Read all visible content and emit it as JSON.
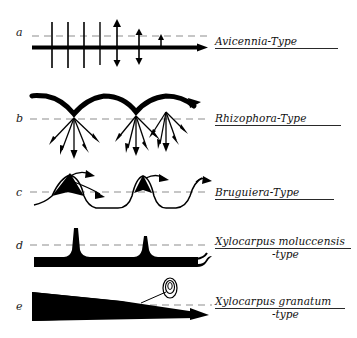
{
  "figure": {
    "background_color": "#ffffff",
    "ink_color": "#000000",
    "dashed_line_color": "#8d8d8d",
    "width": 357,
    "height": 338
  },
  "rows": [
    {
      "letter": "a",
      "label_line1": "Avicennia",
      "label_separator": "-",
      "label_line2": "Type",
      "label_full": "Avicennia-Type",
      "underline": true,
      "diagram": "horizontal-axis-with-ticks-and-arrows"
    },
    {
      "letter": "b",
      "label_line1": "Rhizophora",
      "label_separator": "-",
      "label_line2": "Type",
      "label_full": "Rhizophora-Type",
      "underline": true,
      "diagram": "arches-with-downward-arrow-fans"
    },
    {
      "letter": "c",
      "label_line1": "Bruguiera",
      "label_separator": "-",
      "label_line2": "Type",
      "label_full": "Bruguiera-Type",
      "underline": true,
      "diagram": "wavy-line-with-filled-peaks"
    },
    {
      "letter": "d",
      "label_line1": "Xylocarpus moluccensis",
      "label_separator": "-",
      "label_line2": "type",
      "label_full": "Xylocarpus moluccensis -type",
      "underline": true,
      "two_line": true,
      "diagram": "thick-baseline-with-spikes"
    },
    {
      "letter": "e",
      "label_line1": "Xylocarpus granatum",
      "label_separator": "-",
      "label_line2": "type",
      "label_full": "Xylocarpus granatum -type",
      "underline": true,
      "two_line": true,
      "diagram": "tapering-wedge-with-propagule"
    }
  ]
}
